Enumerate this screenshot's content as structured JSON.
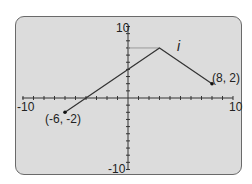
{
  "chart_data": {
    "type": "line",
    "title": "",
    "function_label": "i",
    "x_range": [
      -10,
      10
    ],
    "y_range": [
      -10,
      10
    ],
    "grid": false,
    "axis_labels": {
      "x_min": "-10",
      "x_max": "10",
      "y_max": "10",
      "y_min": "-10"
    },
    "points": [
      {
        "x": -6,
        "y": -2,
        "label": "(-6, -2)",
        "marker": true
      },
      {
        "x": 3,
        "y": 7,
        "label": "",
        "marker": false
      },
      {
        "x": 8,
        "y": 2,
        "label": "(8, 2)",
        "marker": true
      }
    ],
    "annotations": [
      "horizontal reference segment at y=7 from x=0 to x=3"
    ]
  },
  "colors": {
    "panel_bg": "#dcdcdc",
    "panel_border": "#6a6a6a",
    "line": "#333333",
    "reference": "#9a9a9a"
  }
}
